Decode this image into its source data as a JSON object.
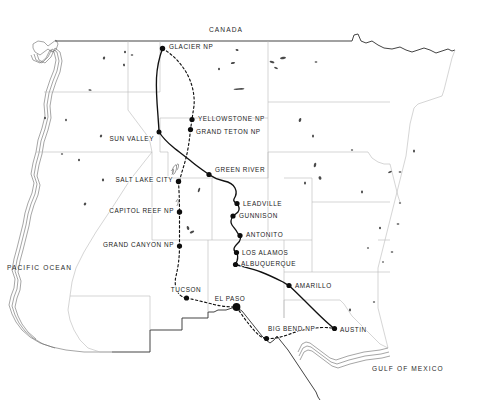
{
  "map": {
    "title": "Western United States Road Trip Route Map",
    "style": "hand-drawn outline map, black and white",
    "colors": {
      "background": "#ffffff",
      "outer_border": "#3a3a3a",
      "state_border": "#b9b9b9",
      "route": "#111111",
      "label_text": "#1a1a1a",
      "marker": "#0d0d0d"
    },
    "region_labels": [
      {
        "name": "canada-label",
        "text": "CANADA",
        "x": 226,
        "y": 32,
        "anchor": "middle"
      },
      {
        "name": "pacific-ocean-label",
        "text": "PACIFIC OCEAN",
        "x": 7,
        "y": 270,
        "anchor": "start"
      },
      {
        "name": "gulf-of-mexico-label",
        "text": "GULF OF MEXICO",
        "x": 372,
        "y": 371,
        "anchor": "start"
      }
    ],
    "stops": [
      {
        "name": "glacier-np",
        "label": "GLACIER NP",
        "x": 162.5,
        "y": 48.5,
        "r": 2.7,
        "lx": 169,
        "ly": 49,
        "anchor": "start"
      },
      {
        "name": "yellowstone-np",
        "label": "YELLOWSTONE NP",
        "x": 192.0,
        "y": 119.5,
        "r": 2.6,
        "lx": 198,
        "ly": 120.5,
        "anchor": "start"
      },
      {
        "name": "grand-teton-np",
        "label": "GRAND TETON NP",
        "x": 190.5,
        "y": 129.5,
        "r": 2.6,
        "lx": 196,
        "ly": 133.5,
        "anchor": "start"
      },
      {
        "name": "sun-valley",
        "label": "SUN VALLEY",
        "x": 159.0,
        "y": 132.0,
        "r": 2.5,
        "lx": 154,
        "ly": 140.5,
        "anchor": "end"
      },
      {
        "name": "green-river",
        "label": "GREEN RIVER",
        "x": 209.0,
        "y": 174.5,
        "r": 2.6,
        "lx": 215,
        "ly": 172.0,
        "anchor": "start"
      },
      {
        "name": "salt-lake-city",
        "label": "SALT LAKE CITY",
        "x": 178.5,
        "y": 181.5,
        "r": 2.7,
        "lx": 173,
        "ly": 182.0,
        "anchor": "end"
      },
      {
        "name": "leadville",
        "label": "LEADVILLE",
        "x": 237.0,
        "y": 203.5,
        "r": 2.6,
        "lx": 243,
        "ly": 205.5,
        "anchor": "start"
      },
      {
        "name": "gunnison",
        "label": "GUNNISON",
        "x": 233.0,
        "y": 216.0,
        "r": 2.6,
        "lx": 239,
        "ly": 218.0,
        "anchor": "start"
      },
      {
        "name": "capitol-reef-np",
        "label": "CAPITOL REEF NP",
        "x": 179.5,
        "y": 212.0,
        "r": 2.7,
        "lx": 174,
        "ly": 212.5,
        "anchor": "end"
      },
      {
        "name": "antonito",
        "label": "ANTONITO",
        "x": 240.0,
        "y": 235.5,
        "r": 2.6,
        "lx": 246,
        "ly": 237.0,
        "anchor": "start"
      },
      {
        "name": "los-alamos",
        "label": "LOS ALAMOS",
        "x": 236.5,
        "y": 252.5,
        "r": 2.6,
        "lx": 242,
        "ly": 254.5,
        "anchor": "start"
      },
      {
        "name": "albuquerque",
        "label": "ALBUQUERQUE",
        "x": 235.5,
        "y": 264.5,
        "r": 2.6,
        "lx": 241,
        "ly": 266.0,
        "anchor": "start"
      },
      {
        "name": "grand-canyon-np",
        "label": "GRAND CANYON NP",
        "x": 179.5,
        "y": 246.0,
        "r": 2.6,
        "lx": 174,
        "ly": 246.5,
        "anchor": "end"
      },
      {
        "name": "tucson",
        "label": "TUCSON",
        "x": 186.5,
        "y": 298.0,
        "r": 2.6,
        "lx": 186,
        "ly": 291.5,
        "anchor": "middle"
      },
      {
        "name": "el-paso",
        "label": "EL PASO",
        "x": 236.5,
        "y": 307.0,
        "r": 3.9,
        "lx": 230,
        "ly": 300.5,
        "anchor": "middle"
      },
      {
        "name": "amarillo",
        "label": "AMARILLO",
        "x": 289.0,
        "y": 285.5,
        "r": 2.6,
        "lx": 295,
        "ly": 287.5,
        "anchor": "start"
      },
      {
        "name": "big-bend-np",
        "label": "BIG BEND NP",
        "x": 266.5,
        "y": 338.5,
        "r": 2.6,
        "lx": 268,
        "ly": 331.0,
        "anchor": "start"
      },
      {
        "name": "austin",
        "label": "AUSTIN",
        "x": 334.5,
        "y": 328.5,
        "r": 2.6,
        "lx": 340,
        "ly": 332.0,
        "anchor": "start"
      }
    ],
    "routes": [
      {
        "name": "outbound-route-solid",
        "style": "solid",
        "legs": [
          "GLACIER NP",
          "SUN VALLEY",
          "GREEN RIVER",
          "LEADVILLE",
          "GUNNISON",
          "ANTONITO",
          "LOS ALAMOS",
          "ALBUQUERQUE",
          "AMARILLO",
          "AUSTIN"
        ]
      },
      {
        "name": "return-route-dashed",
        "style": "dashed",
        "legs": [
          "GLACIER NP",
          "YELLOWSTONE NP",
          "GRAND TETON NP",
          "SALT LAKE CITY",
          "CAPITOL REEF NP",
          "GRAND CANYON NP",
          "TUCSON",
          "EL PASO",
          "BIG BEND NP",
          "AUSTIN"
        ]
      }
    ]
  }
}
